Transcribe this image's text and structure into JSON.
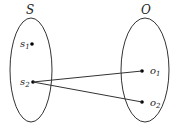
{
  "sets": [
    {
      "id": "S",
      "label": "S",
      "elements": [
        {
          "id": "s1",
          "base": "s",
          "sub": "1"
        },
        {
          "id": "s2",
          "base": "s",
          "sub": "2"
        }
      ]
    },
    {
      "id": "O",
      "label": "O",
      "elements": [
        {
          "id": "o1",
          "base": "o",
          "sub": "1"
        },
        {
          "id": "o2",
          "base": "o",
          "sub": "2"
        }
      ]
    }
  ],
  "mappings": [
    {
      "from": "s2",
      "to": "o1"
    },
    {
      "from": "s2",
      "to": "o2"
    }
  ],
  "colors": {
    "stroke": "#333333",
    "point": "#000000"
  }
}
